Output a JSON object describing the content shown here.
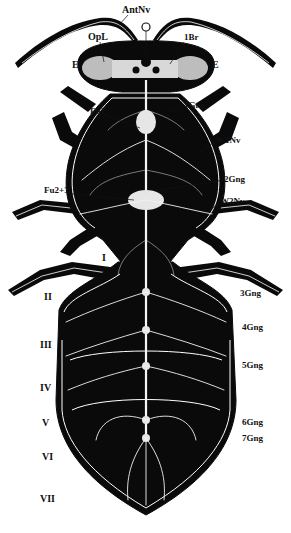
{
  "figure": {
    "colors": {
      "background": "#ffffff",
      "body": "#0a0a0a",
      "nerves": "#f2f2f2",
      "label": "#111111"
    },
    "labels": {
      "antennal_nerve": "AntNv",
      "optic_lobe": "OpL",
      "brain": "1Br",
      "eye_left": "E",
      "eye_right": "E",
      "ocellus": "O",
      "furca_1": "Fu1",
      "ganglion_1": "1Gng",
      "wing_nerve_1": "W1Nv",
      "ganglion_2": "2Gng",
      "furca_2_3": "Fu2+3",
      "wing_nerve_2": "W2Nv",
      "ganglion_3": "3Gng",
      "ganglion_4": "4Gng",
      "ganglion_5": "5Gng",
      "ganglion_6": "6Gng",
      "ganglion_7": "7Gng"
    },
    "segments": [
      "I",
      "II",
      "III",
      "IV",
      "V",
      "VI",
      "VII"
    ]
  }
}
